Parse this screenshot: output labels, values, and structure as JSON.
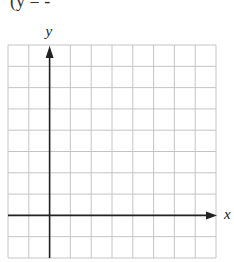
{
  "header": {
    "text": "(y = -"
  },
  "graph": {
    "x_axis_label": "x",
    "y_axis_label": "y",
    "grid_columns": 10,
    "grid_rows": 10,
    "y_axis_column": 2,
    "x_axis_row": 8,
    "grid_color": "#bdbdbd",
    "axis_color": "#222222"
  }
}
